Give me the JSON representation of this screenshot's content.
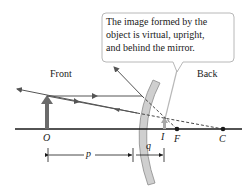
{
  "callout": {
    "lines": [
      "The image formed by the",
      "object is virtual, upright,",
      "and behind the mirror."
    ]
  },
  "regions": {
    "front": "Front",
    "back": "Back"
  },
  "points": {
    "object": "O",
    "image": "I",
    "focal": "F",
    "center": "C"
  },
  "distances": {
    "object_distance": "p",
    "image_distance": "q"
  },
  "colors": {
    "axis": "#1a1a1a",
    "ray": "#555555",
    "object_arrow": "#6b6b6b",
    "image_arrow": "#a8a8a8",
    "mirror_fill": "#cfcfcf",
    "mirror_edge": "#8a8a8a",
    "callout_border": "#b8b8b8"
  }
}
